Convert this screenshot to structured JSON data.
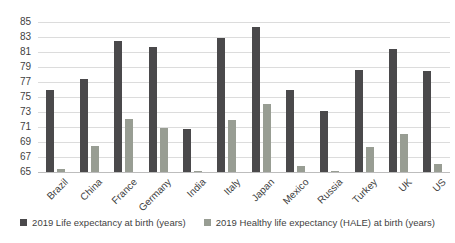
{
  "chart_data": {
    "type": "bar",
    "categories": [
      "Brazil",
      "China",
      "France",
      "Germany",
      "India",
      "Italy",
      "Japan",
      "Mexico",
      "Russia",
      "Turkey",
      "UK",
      "US"
    ],
    "series": [
      {
        "name": "2019 Life expectancy at birth (years)",
        "color": "#4a494b",
        "values": [
          75.9,
          77.4,
          82.5,
          81.7,
          70.8,
          82.9,
          84.3,
          76.0,
          73.2,
          78.6,
          81.4,
          78.5
        ]
      },
      {
        "name": "2019 Healthy life expectancy (HALE) at birth (years)",
        "color": "#989d93",
        "values": [
          65.4,
          68.5,
          72.1,
          70.9,
          60.3,
          71.9,
          74.1,
          65.8,
          64.2,
          68.4,
          70.1,
          66.1
        ]
      }
    ],
    "title": "",
    "xlabel": "",
    "ylabel": "",
    "ylim": [
      65,
      85
    ],
    "yticks": [
      65,
      67,
      69,
      71,
      73,
      75,
      77,
      79,
      81,
      83,
      85
    ],
    "grid": true,
    "legend_position": "bottom",
    "colors": {
      "gridline": "#dcdcdc",
      "axis_baseline": "#bdbdbd",
      "tick_text": "#3f3f3f",
      "background": "#ffffff"
    }
  }
}
